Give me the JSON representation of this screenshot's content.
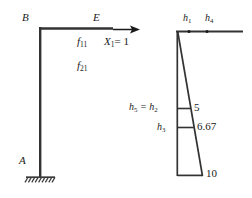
{
  "figure": {
    "type": "structural-engineering-diagram",
    "stroke_color": "#1a1a1a",
    "background": "#ffffff"
  },
  "frame": {
    "joint_b_label": "B",
    "joint_e_label": "E",
    "joint_a_label": "A",
    "flexibility_11": "f",
    "flexibility_11_sub": "11",
    "flexibility_21": "f",
    "flexibility_21_sub": "21",
    "unit_load": "X",
    "unit_load_sub": "1",
    "unit_load_value": "= 1",
    "support_type": "fixed-support"
  },
  "moment_diagram": {
    "segments": [
      {
        "name": "h1",
        "label": "h",
        "sub": "1"
      },
      {
        "name": "h4",
        "label": "h",
        "sub": "4"
      }
    ],
    "left_labels": [
      {
        "name": "h5-h2",
        "text": "h",
        "sub": "5",
        "eq": " = h",
        "sub2": "2"
      },
      {
        "name": "h3",
        "text": "h",
        "sub": "3"
      }
    ],
    "values": [
      {
        "name": "ordinate-5",
        "value": "5"
      },
      {
        "name": "ordinate-667",
        "value": "6.67"
      },
      {
        "name": "ordinate-10",
        "value": "10"
      }
    ]
  }
}
